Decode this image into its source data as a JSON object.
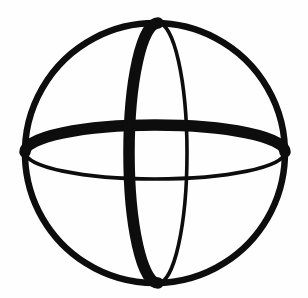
{
  "image": {
    "kind": "line-drawing",
    "subject_name": "sphere-wireframe-symbol",
    "alt_text": "Hand-drawn wireframe sphere: a large circle crossed by a vertical ellipse (meridian) and a horizontal ellipse (equator)",
    "width_px": 308,
    "height_px": 298,
    "background_color": "#fefefe",
    "ink_color": "#0d0d0d",
    "has_text": false,
    "text_content": ""
  },
  "geometry": {
    "outer_circle": {
      "name": "outer-circle",
      "center_x": 155,
      "center_y": 153,
      "radius": 130,
      "stroke_width": 6.5,
      "stroke_color": "#0d0d0d"
    },
    "meridian_ellipse": {
      "name": "vertical-meridian-ellipse",
      "center_x": 158,
      "center_y": 153,
      "radius_x": 29,
      "radius_y": 130,
      "front_half": "left",
      "front_stroke_width": 11.5,
      "back_stroke_width": 3.6,
      "stroke_color": "#0d0d0d"
    },
    "equator_ellipse": {
      "name": "horizontal-equator-ellipse",
      "center_x": 155,
      "center_y": 152,
      "radius_x": 130,
      "radius_y": 27,
      "front_half": "top",
      "front_stroke_width": 11.5,
      "back_stroke_width": 3.6,
      "stroke_color": "#0d0d0d"
    }
  },
  "paths": {
    "outer_circle_d": "M 155 23 A 130 130 0 1 1 154.9 23 Z",
    "meridian_front_d": "M 158 23 C 142 23 129 81 129 153 C 129 225 142 283 158 283",
    "meridian_back_d": "M 158 23 C 174 23 187 81 187 153 C 187 225 174 283 158 283",
    "equator_front_d": "M 25 152 C 25 137 83 125 155 125 C 227 125 285 137 285 152",
    "equator_back_d": "M 25 152 C 25 167 83 179 155 179 C 227 179 285 167 285 152"
  },
  "labels": {
    "figure_title": "",
    "caption": ""
  }
}
